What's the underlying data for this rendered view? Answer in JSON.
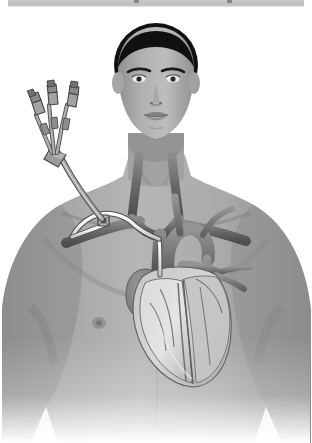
{
  "window": {
    "toolbar_present": true,
    "toolbar_color": "#c2c2c2"
  },
  "illustration": {
    "title": "Central venous catheter placement in the subclavian vein",
    "subject": "Adult male torso, anterior view",
    "style": "desaturated grayscale medical illustration",
    "background_color": "#ffffff",
    "palette": {
      "skin_light": "#b4b4b4",
      "skin_mid": "#9a9a9a",
      "skin_shadow": "#7d7d7d",
      "hair": "#111111",
      "vein_blue": "#6e6e6e",
      "vein_dark": "#565656",
      "artery_red": "#7a7a7a",
      "heart_muscle": "#b9b9b9",
      "catheter_white": "#f2f2f2",
      "catheter_outline": "#5a5a5a",
      "hub_gray": "#8d8d8d"
    },
    "anatomy_labels": [
      "head",
      "neck",
      "right shoulder",
      "left shoulder",
      "chest",
      "clavicle",
      "internal jugular vein",
      "subclavian vein",
      "brachiocephalic vein",
      "superior vena cava",
      "aortic arch",
      "pulmonary artery",
      "right atrium",
      "right ventricle",
      "left ventricle",
      "coronary arteries",
      "nipple"
    ],
    "device": {
      "name": "triple-lumen central venous catheter",
      "lumen_count": 3,
      "parts": [
        "lumen port 1",
        "lumen port 2",
        "lumen port 3",
        "trifurcation hub",
        "extension tubing",
        "skin exit site",
        "subcutaneous tunnel",
        "catheter tip in superior vena cava"
      ],
      "insertion_site": "right infraclavicular chest wall",
      "tip_position": "superior vena cava near right atrium"
    }
  }
}
